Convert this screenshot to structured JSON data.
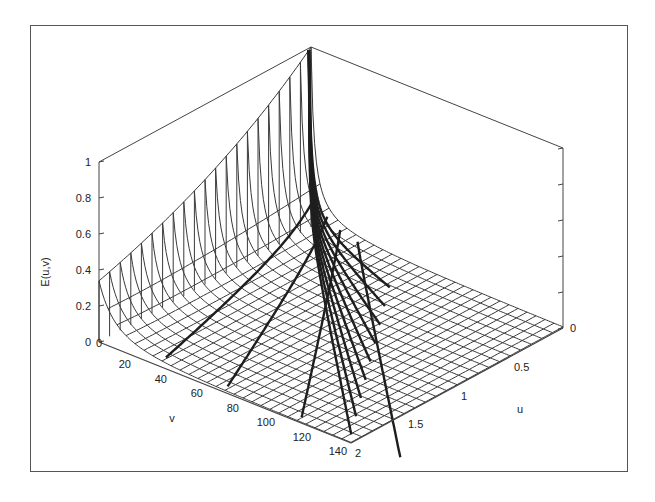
{
  "chart_data": {
    "type": "surface3d",
    "title": "",
    "zlabel": "E(u,v)",
    "xlabel": "v",
    "ylabel": "u",
    "v_range": [
      0,
      140
    ],
    "u_range": [
      0,
      2
    ],
    "z_range": [
      0,
      1
    ],
    "v_ticks": [
      "20",
      "40",
      "60",
      "80",
      "100",
      "120",
      "140"
    ],
    "v_tick_values": [
      20,
      40,
      60,
      80,
      100,
      120,
      140
    ],
    "u_ticks": [
      "0",
      "0.5",
      "1",
      "1.5",
      "2"
    ],
    "u_tick_values": [
      0,
      0.5,
      1,
      1.5,
      2
    ],
    "z_ticks": [
      "0",
      "0.2",
      "0.4",
      "0.6",
      "0.8",
      "1"
    ],
    "z_tick_values": [
      0,
      0.2,
      0.4,
      0.6,
      0.8,
      1
    ],
    "v_origin_label": "0",
    "style": "wireframe mesh with thick highlighted curves",
    "observations": [
      {
        "u": 0,
        "v": 0,
        "E": 1.0
      },
      {
        "u": 2,
        "v": 0,
        "E": 0.34
      },
      {
        "u": 2,
        "v": 20,
        "E": 0.05
      },
      {
        "u": 0,
        "v": 140,
        "E": 0.0
      },
      {
        "u": 2,
        "v": 140,
        "E": 0.0
      }
    ],
    "grid": true,
    "legend": null
  },
  "labels": {
    "zlabel": "E(u,v)",
    "vlabel": "v",
    "ulabel": "u"
  },
  "colors": {
    "mesh": "#3a3a3a",
    "thick": "#1e1e1e",
    "axis": "#444444",
    "frame": "#555555"
  }
}
